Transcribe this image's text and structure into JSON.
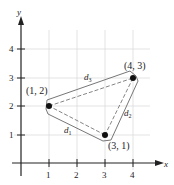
{
  "axes": {
    "x_label": "x",
    "y_label": "y",
    "x_ticks": [
      "1",
      "2",
      "3",
      "4"
    ],
    "y_ticks": [
      "1",
      "2",
      "3",
      "4"
    ]
  },
  "points": [
    {
      "label": "(1, 2)",
      "x": 1,
      "y": 2
    },
    {
      "label": "(4, 3)",
      "x": 4,
      "y": 3
    },
    {
      "label": "(3, 1)",
      "x": 3,
      "y": 1
    }
  ],
  "distances": [
    {
      "name": "d",
      "sub": "1",
      "from": "(1, 2)",
      "to": "(3, 1)"
    },
    {
      "name": "d",
      "sub": "2",
      "from": "(3, 1)",
      "to": "(4, 3)"
    },
    {
      "name": "d",
      "sub": "3",
      "from": "(1, 2)",
      "to": "(4, 3)"
    }
  ],
  "colors": {
    "grid": "#d8d8d8",
    "axis": "#222222",
    "outline": "#555555",
    "dash": "#555555"
  }
}
